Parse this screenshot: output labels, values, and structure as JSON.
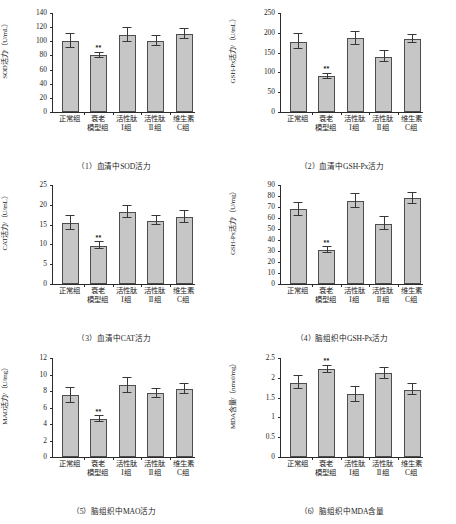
{
  "figure": {
    "categories": [
      "正常组",
      "衰老\n模型组",
      "活性肽\nⅠ组",
      "活性肽\nⅡ组",
      "维生素\nC组"
    ],
    "footnote": "",
    "colors": {
      "bar_fill": "#c6c6c6",
      "bar_stroke": "#4d4d4d",
      "axis": "#2b2b2b",
      "text": "#1d1d1d"
    }
  },
  "chart_data": [
    {
      "type": "bar",
      "panel": "(1)",
      "title": "（1）血清中SOD活力",
      "ylabel": "SOD活力/（U/mL）",
      "xlabel": "",
      "categories": [
        "正常组",
        "衰老模型组",
        "活性肽Ⅰ组",
        "活性肽Ⅱ组",
        "维生素C组"
      ],
      "values": [
        100,
        80,
        109,
        101,
        110
      ],
      "errors": [
        10,
        4,
        10,
        7,
        7
      ],
      "significance": [
        "",
        "**",
        "",
        "",
        ""
      ],
      "ylim": [
        0,
        140
      ],
      "yticks": [
        0,
        20,
        40,
        60,
        80,
        100,
        120,
        140
      ],
      "grid": false,
      "legend": "none"
    },
    {
      "type": "bar",
      "panel": "(2)",
      "title": "（2）血清中GSH-Px活力",
      "ylabel": "GSH-Px活力/（U/mL）",
      "xlabel": "",
      "categories": [
        "正常组",
        "衰老模型组",
        "活性肽Ⅰ组",
        "活性肽Ⅱ组",
        "维生素C组"
      ],
      "values": [
        178,
        90,
        186,
        140,
        184
      ],
      "errors": [
        18,
        7,
        17,
        13,
        10
      ],
      "significance": [
        "",
        "**",
        "",
        "",
        ""
      ],
      "ylim": [
        0,
        250
      ],
      "yticks": [
        0,
        50,
        100,
        150,
        200,
        250
      ],
      "grid": false,
      "legend": "none"
    },
    {
      "type": "bar",
      "panel": "(3)",
      "title": "（3）血清中CAT活力",
      "ylabel": "CAT活力/（U/mL）",
      "xlabel": "",
      "categories": [
        "正常组",
        "衰老模型组",
        "活性肽Ⅰ组",
        "活性肽Ⅱ组",
        "维生素C组"
      ],
      "values": [
        15.5,
        9.7,
        18.2,
        16.0,
        17.0
      ],
      "errors": [
        1.8,
        0.8,
        1.6,
        1.2,
        1.5
      ],
      "significance": [
        "",
        "**",
        "",
        "",
        ""
      ],
      "ylim": [
        0,
        25
      ],
      "yticks": [
        0,
        5,
        10,
        15,
        20,
        25
      ],
      "grid": false,
      "legend": "none"
    },
    {
      "type": "bar",
      "panel": "(4)",
      "title": "（4）脑组织中GSH-Px活力",
      "ylabel": "GSH-Px活力/（U/mg）",
      "xlabel": "",
      "categories": [
        "正常组",
        "衰老模型组",
        "活性肽Ⅰ组",
        "活性肽Ⅱ组",
        "维生素C组"
      ],
      "values": [
        68,
        31,
        75.5,
        55,
        78
      ],
      "errors": [
        6,
        2.5,
        6,
        6,
        5
      ],
      "significance": [
        "",
        "**",
        "",
        "",
        ""
      ],
      "ylim": [
        0,
        90
      ],
      "yticks": [
        0,
        10,
        20,
        30,
        40,
        50,
        60,
        70,
        80,
        90
      ],
      "grid": false,
      "legend": "none"
    },
    {
      "type": "bar",
      "panel": "(5)",
      "title": "（5）脑组织中MAO活力",
      "ylabel": "MAO活力/（U/mg）",
      "xlabel": "",
      "categories": [
        "正常组",
        "衰老模型组",
        "活性肽Ⅰ组",
        "活性肽Ⅱ组",
        "维生素C组"
      ],
      "values": [
        7.5,
        4.6,
        8.7,
        7.7,
        8.2
      ],
      "errors": [
        0.9,
        0.35,
        0.9,
        0.6,
        0.6
      ],
      "significance": [
        "",
        "**",
        "",
        "",
        ""
      ],
      "ylim": [
        0,
        12
      ],
      "yticks": [
        0,
        2,
        4,
        6,
        8,
        10,
        12
      ],
      "grid": false,
      "legend": "none"
    },
    {
      "type": "bar",
      "panel": "(6)",
      "title": "（6）脑组织中MDA含量",
      "ylabel": "MDA含量/（nmol/mg）",
      "xlabel": "",
      "categories": [
        "正常组",
        "衰老模型组",
        "活性肽Ⅰ组",
        "活性肽Ⅱ组",
        "维生素C组"
      ],
      "values": [
        1.88,
        2.21,
        1.58,
        2.11,
        1.7
      ],
      "errors": [
        0.17,
        0.09,
        0.19,
        0.14,
        0.14
      ],
      "significance": [
        "",
        "**",
        "",
        "",
        ""
      ],
      "ylim": [
        0,
        2.5
      ],
      "yticks": [
        0,
        0.5,
        1.0,
        1.5,
        2.0,
        2.5
      ],
      "grid": false,
      "legend": "none"
    }
  ]
}
